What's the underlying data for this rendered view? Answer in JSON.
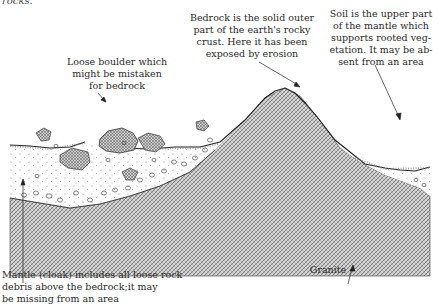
{
  "top_fragment": "rocks.",
  "labels": {
    "bedrock": {
      "lines": [
        "Bedrock is the solid outer",
        "part of the earth's rocky",
        "crust. Here it has been",
        "exposed by erosion"
      ]
    },
    "soil": {
      "lines": [
        "Soil is the upper part",
        "of the mantle which",
        "supports rooted veg-",
        "etation. It may be ab-",
        "sent from an area"
      ]
    },
    "boulder": {
      "lines": [
        "Loose boulder which",
        "might be mistaken",
        "for bedrock"
      ]
    },
    "mantle": {
      "lines": [
        "Mantle (cloak) includes all loose rock",
        "debris above the bedrock;it may",
        "be missing from an area"
      ]
    },
    "granite": {
      "lines": [
        "Granite"
      ]
    }
  },
  "colors": {
    "ink": "#2a2a2a",
    "bedrock_hatch": "#6a6a6a",
    "mantle_dots": "#9a9a9a",
    "background": "#ffffff"
  }
}
